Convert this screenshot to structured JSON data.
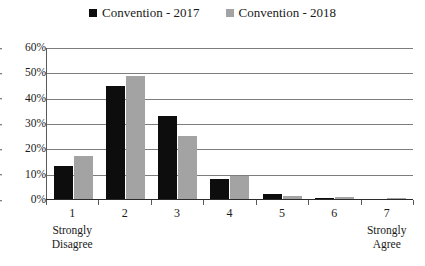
{
  "chart_data": {
    "type": "bar",
    "title": "",
    "xlabel": "",
    "ylabel": "",
    "categories": [
      "1",
      "2",
      "3",
      "4",
      "5",
      "6",
      "7"
    ],
    "category_anchors": {
      "first": "Strongly\nDisagree",
      "last": "Strongly\nAgree"
    },
    "series": [
      {
        "name": "Convention - 2017",
        "color": "#0d0d0d",
        "values": [
          13,
          45,
          33,
          8,
          2,
          0.5,
          0
        ]
      },
      {
        "name": "Convention - 2018",
        "color": "#a3a3a3",
        "values": [
          17,
          49,
          25,
          9,
          1,
          0.7,
          0.5
        ]
      }
    ],
    "ylim": [
      0,
      60
    ],
    "yticks": [
      "0%",
      "10%",
      "20%",
      "30%",
      "40%",
      "50%",
      "60%"
    ],
    "ytick_values": [
      0,
      10,
      20,
      30,
      40,
      50,
      60
    ],
    "grid": true,
    "legend_position": "top-center",
    "value_unit": "%"
  },
  "legend": {
    "items": [
      {
        "label": "Convention - 2017",
        "swatch_name": "legend-swatch-2017"
      },
      {
        "label": "Convention - 2018",
        "swatch_name": "legend-swatch-2018"
      }
    ]
  }
}
